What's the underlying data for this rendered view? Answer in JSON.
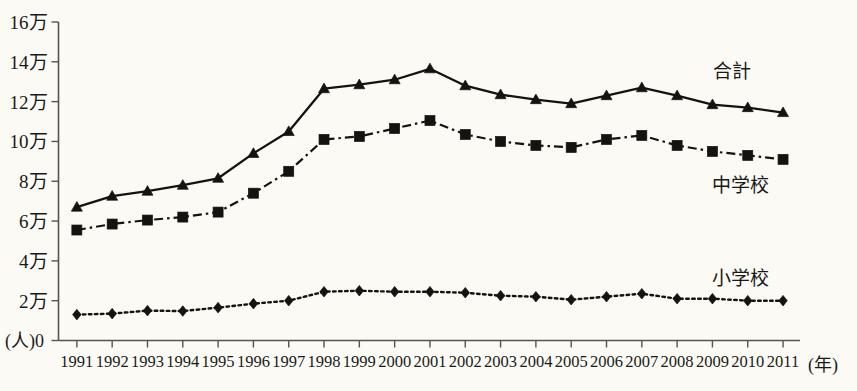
{
  "chart_data": {
    "type": "line",
    "title": "",
    "xlabel": "(年)",
    "ylabel": "(人)",
    "y_unit_suffix": "万",
    "grid": false,
    "legend_position": "inline-right",
    "ylim": [
      0,
      160000
    ],
    "ytick_labels": [
      "16万",
      "14万",
      "12万",
      "10万",
      "8万",
      "6万",
      "4万",
      "2万",
      "0"
    ],
    "ytick_values": [
      160000,
      140000,
      120000,
      100000,
      80000,
      60000,
      40000,
      20000,
      0
    ],
    "categories": [
      "1991",
      "1992",
      "1993",
      "1994",
      "1995",
      "1996",
      "1997",
      "1998",
      "1999",
      "2000",
      "2001",
      "2002",
      "2003",
      "2004",
      "2005",
      "2006",
      "2007",
      "2008",
      "2009",
      "2010",
      "2011"
    ],
    "series": [
      {
        "name": "合計",
        "marker": "triangle",
        "line_style": "solid",
        "label_text": "合計",
        "values": [
          67000,
          72500,
          75000,
          78000,
          81500,
          94000,
          105000,
          126500,
          128500,
          131000,
          136500,
          128000,
          123500,
          121000,
          119000,
          123000,
          127000,
          123000,
          118500,
          117000,
          114500
        ]
      },
      {
        "name": "中学校",
        "marker": "square",
        "line_style": "dash-dot",
        "label_text": "中学校",
        "values": [
          55500,
          58500,
          60500,
          62000,
          64500,
          74000,
          85000,
          101000,
          102500,
          106500,
          110500,
          103500,
          100000,
          98000,
          97000,
          101000,
          103000,
          98000,
          95000,
          93000,
          91000
        ]
      },
      {
        "name": "小学校",
        "marker": "diamond",
        "line_style": "dotted",
        "label_text": "小学校",
        "values": [
          13000,
          13500,
          15000,
          14800,
          16500,
          18500,
          20000,
          24500,
          25000,
          24500,
          24500,
          24000,
          22500,
          22000,
          20500,
          22000,
          23500,
          21000,
          21000,
          20000,
          20000
        ]
      }
    ]
  },
  "axes": {
    "x_unit_label": "(年)",
    "y_unit_label": "(人)",
    "y_zero_label": "0"
  }
}
